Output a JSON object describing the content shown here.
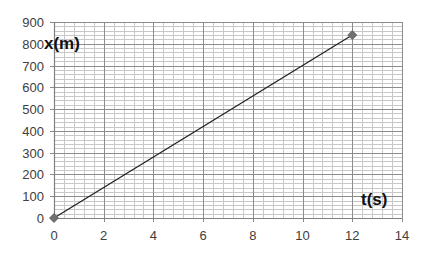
{
  "chart_data": {
    "type": "scatter",
    "title": "",
    "xlabel": "t(s)",
    "ylabel": "x(m)",
    "xlim": [
      0,
      14
    ],
    "ylim": [
      0,
      900
    ],
    "x_ticks": [
      0,
      2,
      4,
      6,
      8,
      10,
      12,
      14
    ],
    "y_ticks": [
      0,
      100,
      200,
      300,
      400,
      500,
      600,
      700,
      800,
      900
    ],
    "x_tick_labels": [
      "0",
      "2",
      "4",
      "6",
      "8",
      "10",
      "12",
      "14"
    ],
    "y_tick_labels": [
      "0",
      "100",
      "200",
      "300",
      "400",
      "500",
      "600",
      "700",
      "800",
      "900"
    ],
    "grid": true,
    "minor_grid": {
      "x_step": 0.4,
      "y_step": 20
    },
    "legend": null,
    "series": [
      {
        "name": "x(t)",
        "line": true,
        "marker": "diamond",
        "color": "#707070",
        "line_color": "#222222",
        "x": [
          0,
          12
        ],
        "y": [
          0,
          840
        ]
      }
    ]
  },
  "colors": {
    "major_grid": "#8c8c8c",
    "minor_grid": "#c8c8c8",
    "axis": "#808080",
    "text": "#404040"
  }
}
